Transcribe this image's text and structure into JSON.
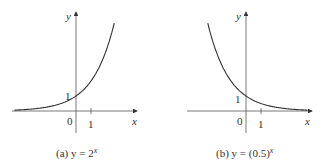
{
  "chart_data": [
    {
      "type": "line",
      "title": "(a) y = 2^x",
      "caption_prefix": "(a) y = 2",
      "caption_exp": "x",
      "xlabel": "x",
      "ylabel": "y",
      "series": [
        {
          "name": "y = 2^x",
          "function": "2^x",
          "x": [
            -4,
            -3,
            -2,
            -1,
            0,
            1,
            2,
            3
          ],
          "values": [
            0.0625,
            0.125,
            0.25,
            0.5,
            1,
            2,
            4,
            8
          ]
        }
      ],
      "tick_labels": {
        "origin": "0",
        "x_one": "1",
        "y_one": "1"
      },
      "xlim": [
        -4.1,
        4
      ],
      "ylim": [
        -1.9,
        6.5
      ],
      "grid": false
    },
    {
      "type": "line",
      "title": "(b) y = (0.5)^x",
      "caption_prefix": "(b) y = (0.5)",
      "caption_exp": "x",
      "xlabel": "x",
      "ylabel": "y",
      "series": [
        {
          "name": "y = (0.5)^x",
          "function": "0.5^x",
          "x": [
            -3,
            -2,
            -1,
            0,
            1,
            2,
            3,
            4
          ],
          "values": [
            8,
            4,
            2,
            1,
            0.5,
            0.25,
            0.125,
            0.0625
          ]
        }
      ],
      "tick_labels": {
        "origin": "0",
        "x_one": "1",
        "y_one": "1"
      },
      "xlim": [
        -4,
        4.1
      ],
      "ylim": [
        -1.9,
        6.5
      ],
      "grid": false
    }
  ]
}
